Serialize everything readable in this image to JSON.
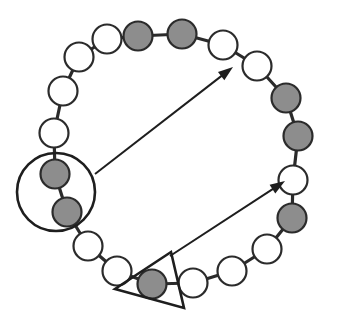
{
  "figure": {
    "type": "ring-node-diagram",
    "width": 339,
    "height": 330,
    "background_color": "#ffffff",
    "title": "",
    "caption": "",
    "colors": {
      "node_filled": "#8d8d8d",
      "node_open": "#ffffff",
      "node_outline": "#2b2b2b",
      "edge": "#2b2b2b",
      "annotation": "#1e1e1e",
      "arrow": "#1e1e1e"
    },
    "legend": [],
    "node_radius": 14.5,
    "node_count": 20,
    "filled_count": 7,
    "open_count": 13
  },
  "nodes": [
    {
      "id": "n1",
      "label": "",
      "state": "filled",
      "cx": 138,
      "cy": 36
    },
    {
      "id": "n2",
      "label": "",
      "state": "filled",
      "cx": 182,
      "cy": 34
    },
    {
      "id": "n3",
      "label": "",
      "state": "open",
      "cx": 223,
      "cy": 45
    },
    {
      "id": "n4",
      "label": "",
      "state": "open",
      "cx": 257,
      "cy": 66
    },
    {
      "id": "n5",
      "label": "",
      "state": "filled",
      "cx": 286,
      "cy": 98
    },
    {
      "id": "n6",
      "label": "",
      "state": "filled",
      "cx": 298,
      "cy": 136
    },
    {
      "id": "n7",
      "label": "",
      "state": "open",
      "cx": 293,
      "cy": 180
    },
    {
      "id": "n8",
      "label": "",
      "state": "filled",
      "cx": 292,
      "cy": 218
    },
    {
      "id": "n9",
      "label": "",
      "state": "open",
      "cx": 267,
      "cy": 249
    },
    {
      "id": "n10",
      "label": "",
      "state": "open",
      "cx": 232,
      "cy": 271
    },
    {
      "id": "n11",
      "label": "",
      "state": "open",
      "cx": 193,
      "cy": 283
    },
    {
      "id": "n12",
      "label": "",
      "state": "filled",
      "cx": 152,
      "cy": 284
    },
    {
      "id": "n13",
      "label": "",
      "state": "open",
      "cx": 117,
      "cy": 271
    },
    {
      "id": "n14",
      "label": "",
      "state": "open",
      "cx": 88,
      "cy": 246
    },
    {
      "id": "n15",
      "label": "",
      "state": "filled",
      "cx": 67,
      "cy": 212
    },
    {
      "id": "n16",
      "label": "",
      "state": "filled",
      "cx": 55,
      "cy": 174
    },
    {
      "id": "n17",
      "label": "",
      "state": "open",
      "cx": 54,
      "cy": 133
    },
    {
      "id": "n18",
      "label": "",
      "state": "open",
      "cx": 63,
      "cy": 91
    },
    {
      "id": "n19",
      "label": "",
      "state": "open",
      "cx": 79,
      "cy": 57
    },
    {
      "id": "n20",
      "label": "",
      "state": "open",
      "cx": 107,
      "cy": 39
    }
  ],
  "edges": [
    {
      "from": "n1",
      "to": "n2"
    },
    {
      "from": "n2",
      "to": "n3"
    },
    {
      "from": "n3",
      "to": "n4"
    },
    {
      "from": "n4",
      "to": "n5"
    },
    {
      "from": "n5",
      "to": "n6"
    },
    {
      "from": "n6",
      "to": "n7"
    },
    {
      "from": "n7",
      "to": "n8"
    },
    {
      "from": "n8",
      "to": "n9"
    },
    {
      "from": "n9",
      "to": "n10"
    },
    {
      "from": "n10",
      "to": "n11"
    },
    {
      "from": "n11",
      "to": "n12"
    },
    {
      "from": "n12",
      "to": "n13"
    },
    {
      "from": "n13",
      "to": "n14"
    },
    {
      "from": "n14",
      "to": "n15"
    },
    {
      "from": "n15",
      "to": "n16"
    },
    {
      "from": "n16",
      "to": "n17"
    },
    {
      "from": "n17",
      "to": "n18"
    },
    {
      "from": "n18",
      "to": "n19"
    },
    {
      "from": "n19",
      "to": "n20"
    },
    {
      "from": "n20",
      "to": "n1"
    }
  ],
  "annotations": [
    {
      "id": "a1",
      "kind": "circle",
      "label": "",
      "cx": 56,
      "cy": 192,
      "r": 39,
      "encloses": [
        "n15",
        "n16"
      ]
    },
    {
      "id": "a2",
      "kind": "triangle",
      "label": "",
      "points": "171,252 184,308 115,289",
      "encloses": [
        "n12"
      ]
    }
  ],
  "arrows": [
    {
      "id": "arrow-1",
      "label": "",
      "from_annotation": "a1",
      "to_node": "n3",
      "x1": 95,
      "y1": 174,
      "x2": 233,
      "y2": 67
    },
    {
      "id": "arrow-2",
      "label": "",
      "from_annotation": "a2",
      "to_node": "n7",
      "x1": 170,
      "y1": 256,
      "x2": 285,
      "y2": 181
    }
  ]
}
